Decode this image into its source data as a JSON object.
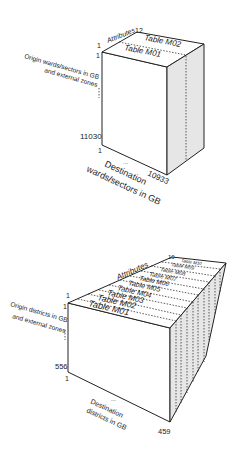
{
  "diagram1": {
    "attributes_label": "Attributes",
    "attributes_max": "12",
    "origin_label_line1": "Origin wards/sectors in GB",
    "origin_label_line2": "and external zones",
    "origin_start": "1",
    "origin_start_top": "1",
    "origin_end": "11030",
    "dest_start": "1",
    "dest_end": "10933",
    "dest_label_line1": "Destination",
    "dest_label_line2": "wards/sectors in GB",
    "ellipsis": "...",
    "tables": [
      "Table M01",
      "Table M02"
    ]
  },
  "diagram2": {
    "attributes_label": "Attributes",
    "attributes_max": "10",
    "origin_label_line1": "Origin districts in GB",
    "origin_label_line2": "and external zones",
    "origin_start": "1",
    "origin_start_top": "1",
    "origin_end": "556",
    "dest_start": "1",
    "dest_end": "459",
    "dest_label_line1": "Destination",
    "dest_label_line2": "districts in GB",
    "ellipsis": "...",
    "tables": [
      "Table M01",
      "Table M02",
      "Table M03",
      "Table M04",
      "Table M05",
      "Table M06",
      "Table M07",
      "Table M08",
      "Table M09",
      "Table M10"
    ]
  },
  "colors": {
    "line": "#222222",
    "side_face": "#e6e6e6",
    "background": "#ffffff"
  }
}
